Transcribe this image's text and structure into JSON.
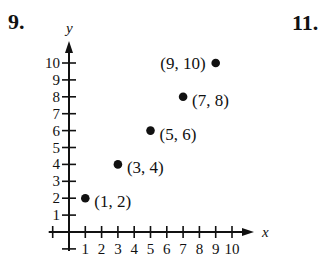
{
  "problems": {
    "left_number": "9.",
    "right_number": "11."
  },
  "chart_data": {
    "type": "scatter",
    "title": "",
    "xlabel": "x",
    "ylabel": "y",
    "xlim": [
      -1,
      10
    ],
    "ylim": [
      -1,
      10
    ],
    "grid": false,
    "legend": null,
    "x_ticks": [
      1,
      2,
      3,
      4,
      5,
      6,
      7,
      8,
      9,
      10
    ],
    "y_ticks": [
      1,
      2,
      3,
      4,
      5,
      6,
      7,
      8,
      9,
      10
    ],
    "series": [
      {
        "name": "points",
        "points": [
          {
            "x": 1,
            "y": 2,
            "label": "(1, 2)"
          },
          {
            "x": 3,
            "y": 4,
            "label": "(3, 4)"
          },
          {
            "x": 5,
            "y": 6,
            "label": "(5, 6)"
          },
          {
            "x": 7,
            "y": 8,
            "label": "(7, 8)"
          },
          {
            "x": 9,
            "y": 10,
            "label": "(9, 10)"
          }
        ]
      }
    ],
    "annotations": [
      "(1, 2)",
      "(3, 4)",
      "(5, 6)",
      "(7, 8)",
      "(9, 10)"
    ],
    "colors": {
      "ink": "#111111",
      "background": "#ffffff"
    }
  }
}
